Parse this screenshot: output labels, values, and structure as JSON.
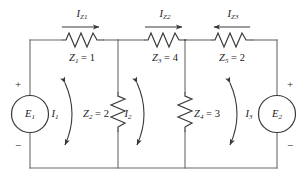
{
  "diagram": {
    "type": "electrical-circuit-schematic",
    "stroke_color": "#3a3a3a",
    "text_color": "#1a1a1a",
    "background_color": "#ffffff"
  },
  "sources": [
    {
      "id": "E1",
      "symbol": "E",
      "subscript": "1",
      "plus": "+",
      "minus": "−",
      "position": "left-branch",
      "plus_at": "top",
      "minus_at": "bottom"
    },
    {
      "id": "E2",
      "symbol": "E",
      "subscript": "2",
      "plus": "+",
      "minus": "−",
      "position": "right-branch",
      "plus_at": "top",
      "minus_at": "bottom"
    }
  ],
  "series_impedances": [
    {
      "id": "Z1",
      "symbol": "Z",
      "subscript": "1",
      "equals": "=",
      "value": "1",
      "label": "Z₁ = 1",
      "branch": "top-left"
    },
    {
      "id": "Z3",
      "symbol": "Z",
      "subscript": "3",
      "equals": "=",
      "value": "4",
      "label": "Z₃ = 4",
      "branch": "top-middle"
    },
    {
      "id": "Z5",
      "symbol": "Z",
      "subscript": "5",
      "equals": "=",
      "value": "2",
      "label": "Z₅ = 2",
      "branch": "top-right"
    }
  ],
  "shunt_impedances": [
    {
      "id": "Z2",
      "symbol": "Z",
      "subscript": "2",
      "equals": "=",
      "value": "2",
      "label": "Z₂ = 2",
      "branch": "first-vertical"
    },
    {
      "id": "Z4",
      "symbol": "Z",
      "subscript": "4",
      "equals": "=",
      "value": "3",
      "label": "Z₄ = 3",
      "branch": "second-vertical"
    }
  ],
  "branch_currents": [
    {
      "id": "IZ1",
      "symbol": "I",
      "subscript": "Z1",
      "label": "I_Z1",
      "direction": "right",
      "over": "Z1"
    },
    {
      "id": "IZ2",
      "symbol": "I",
      "subscript": "Z2",
      "label": "I_Z2",
      "direction": "right",
      "over": "Z3"
    },
    {
      "id": "IZ3",
      "symbol": "I",
      "subscript": "Z3",
      "label": "I_Z3",
      "direction": "left",
      "over": "Z5"
    }
  ],
  "mesh_currents": [
    {
      "id": "I1",
      "symbol": "I",
      "subscript": "1",
      "label": "I_1",
      "rotation": "counterclockwise",
      "mesh": "left"
    },
    {
      "id": "I2",
      "symbol": "I",
      "subscript": "2",
      "label": "I_2",
      "rotation": "counterclockwise",
      "mesh": "middle"
    },
    {
      "id": "I3",
      "symbol": "I",
      "subscript": "3",
      "label": "I_3",
      "rotation": "counterclockwise",
      "mesh": "right"
    }
  ]
}
